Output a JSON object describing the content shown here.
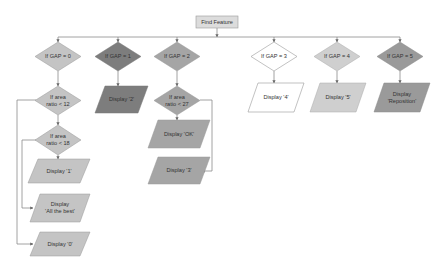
{
  "start": {
    "label": "Find Feature",
    "color": "#dcdcdc"
  },
  "gap_decisions": [
    {
      "label": "If GAP = 0",
      "color": "#c4c4c4"
    },
    {
      "label": "If GAP = 1",
      "color": "#7d7d7d"
    },
    {
      "label": "If GAP = 2",
      "color": "#a5a5a5"
    },
    {
      "label": "If GAP = 3",
      "color": "#ffffff"
    },
    {
      "label": "If GAP = 4",
      "color": "#cfcfcf"
    },
    {
      "label": "If GAP = 5",
      "color": "#9a9a9a"
    }
  ],
  "area_decisions": [
    {
      "label": "If area\nratio < 12",
      "color": "#c4c4c4"
    },
    {
      "label": "If area\nratio < 18",
      "color": "#c4c4c4"
    },
    {
      "label": "If area\nratio < 27",
      "color": "#a5a5a5"
    }
  ],
  "outputs": [
    {
      "label": "Display '1'",
      "color": "#c4c4c4"
    },
    {
      "label": "Display\n'All the best'",
      "color": "#c4c4c4"
    },
    {
      "label": "Display '0'",
      "color": "#c4c4c4"
    },
    {
      "label": "Display '2'",
      "color": "#7d7d7d"
    },
    {
      "label": "Display 'OK'",
      "color": "#a5a5a5"
    },
    {
      "label": "Display '3'",
      "color": "#a5a5a5"
    },
    {
      "label": "Display '4'",
      "color": "#ffffff"
    },
    {
      "label": "Display '5'",
      "color": "#cfcfcf"
    },
    {
      "label": "Display\n'Reposition'",
      "color": "#9a9a9a"
    }
  ]
}
